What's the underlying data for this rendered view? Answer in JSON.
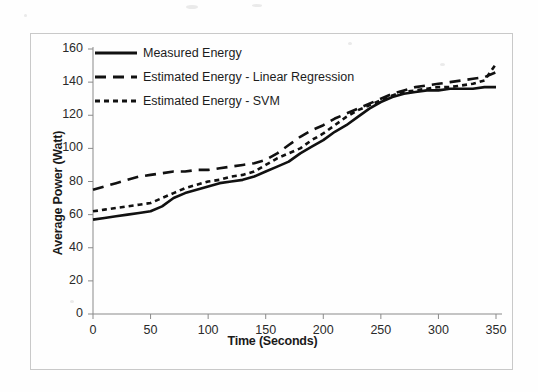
{
  "figure": {
    "background_color": "#fefefe",
    "frame_color": "#c9c9c9",
    "ink_color": "#1a1a1a"
  },
  "chart_data": {
    "type": "line",
    "title": "",
    "subtitle": "",
    "xlabel": "Time (Seconds)",
    "ylabel": "Average Power (Watt)",
    "xlim": [
      0,
      350
    ],
    "ylim": [
      0,
      160
    ],
    "xticks": [
      0,
      50,
      100,
      150,
      200,
      250,
      300,
      350
    ],
    "yticks": [
      0,
      20,
      40,
      60,
      80,
      100,
      120,
      140,
      160
    ],
    "grid": false,
    "legend_position": "upper-left-inside",
    "x": [
      0,
      10,
      20,
      30,
      40,
      50,
      60,
      70,
      80,
      90,
      100,
      110,
      120,
      130,
      140,
      150,
      160,
      170,
      180,
      190,
      200,
      210,
      220,
      230,
      240,
      250,
      260,
      270,
      280,
      290,
      300,
      310,
      320,
      330,
      340,
      350
    ],
    "series": [
      {
        "name": "Measured Energy",
        "style": "solid",
        "color": "#111111",
        "width": 2.6,
        "values": [
          57,
          58,
          59,
          60,
          61,
          62,
          65,
          70,
          73,
          75,
          77,
          79,
          80,
          81,
          83,
          86,
          89,
          92,
          97,
          101,
          105,
          110,
          114,
          119,
          124,
          128,
          131,
          133,
          134,
          135,
          135,
          136,
          136,
          136,
          137,
          137
        ]
      },
      {
        "name": "Estimated Energy - Linear Regression",
        "style": "long-dash",
        "color": "#111111",
        "width": 2.6,
        "values": [
          75,
          77,
          79,
          81,
          83,
          84,
          85,
          86,
          86,
          87,
          87,
          88,
          89,
          90,
          91,
          93,
          97,
          102,
          107,
          111,
          114,
          118,
          121,
          124,
          127,
          130,
          133,
          135,
          137,
          138,
          139,
          140,
          141,
          142,
          143,
          146
        ]
      },
      {
        "name": "Estimated Energy - SVM",
        "style": "short-dash",
        "color": "#111111",
        "width": 2.6,
        "values": [
          62,
          63,
          64,
          65,
          66,
          67,
          70,
          73,
          76,
          78,
          80,
          81,
          83,
          84,
          86,
          90,
          94,
          97,
          100,
          105,
          109,
          114,
          119,
          123,
          126,
          129,
          132,
          134,
          135,
          136,
          137,
          137,
          138,
          139,
          141,
          151
        ]
      }
    ]
  },
  "legend": {
    "items": [
      {
        "label": "Measured Energy",
        "style": "solid"
      },
      {
        "label": "Estimated Energy - Linear Regression",
        "style": "long-dash"
      },
      {
        "label": "Estimated Energy - SVM",
        "style": "short-dash"
      }
    ]
  }
}
